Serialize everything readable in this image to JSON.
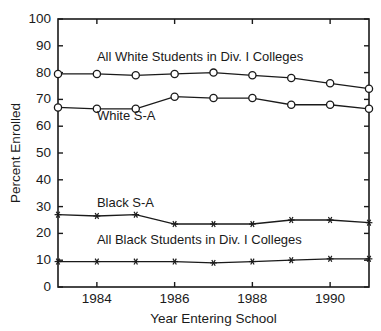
{
  "chart_data": {
    "type": "line",
    "title": "",
    "xlabel": "Year Entering School",
    "ylabel": "Percent Enrolled",
    "xlim": [
      1983,
      1991
    ],
    "ylim": [
      0,
      100
    ],
    "ytick_step": 10,
    "grid": false,
    "legend_position": "inline-annotations",
    "x": [
      1983,
      1984,
      1985,
      1986,
      1987,
      1988,
      1989,
      1990,
      1991
    ],
    "xticks": [
      1984,
      1986,
      1988,
      1990
    ],
    "xtick_labels": [
      "1984",
      "1986",
      "1988",
      "1990"
    ],
    "yticks": [
      0,
      10,
      20,
      30,
      40,
      50,
      60,
      70,
      80,
      90,
      100
    ],
    "ytick_labels": [
      "0",
      "10",
      "20",
      "30",
      "40",
      "50",
      "60",
      "70",
      "80",
      "90",
      "100"
    ],
    "series": [
      {
        "name": "All White Students in Div. I Colleges",
        "marker": "open-circle",
        "values": [
          79.5,
          79.5,
          79.0,
          79.5,
          80.0,
          79.0,
          78.0,
          76.0,
          74.0
        ]
      },
      {
        "name": "White S-A",
        "marker": "open-circle",
        "values": [
          67.0,
          66.5,
          66.5,
          71.0,
          70.5,
          70.5,
          68.0,
          68.0,
          66.5
        ]
      },
      {
        "name": "Black S-A",
        "marker": "star",
        "values": [
          27.0,
          26.5,
          27.0,
          23.5,
          23.5,
          23.5,
          25.0,
          25.0,
          24.0
        ]
      },
      {
        "name": "All Black Students in Div. I Colleges",
        "marker": "star",
        "values": [
          9.5,
          9.5,
          9.5,
          9.5,
          9.0,
          9.5,
          10.0,
          10.5,
          10.5
        ]
      }
    ],
    "annotations": [
      {
        "text": "All White Students in Div. I Colleges",
        "x": 1984.0,
        "y": 84.5
      },
      {
        "text": "White S-A",
        "x": 1984.0,
        "y": 62.5
      },
      {
        "text": "Black S-A",
        "x": 1984.0,
        "y": 30.0
      },
      {
        "text": "All Black Students in Div. I Colleges",
        "x": 1984.0,
        "y": 16.0
      }
    ]
  }
}
